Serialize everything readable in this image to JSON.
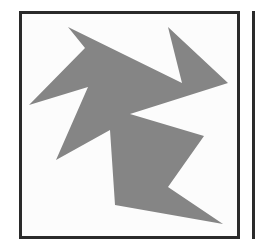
{
  "figure": {
    "shape_fill": "#858585",
    "border_color": "#2a2a2a",
    "background": "#fcfcfc",
    "shape_points": "68,27 85,48 29,105 88,87 56,160 110,130 115,205 223,224 168,187 204,136 130,114 228,83 168,27 182,83"
  }
}
